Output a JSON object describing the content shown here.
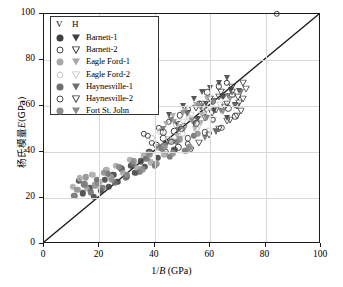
{
  "chart": {
    "type": "scatter",
    "title": "",
    "xlabel": "1/B (GPa)",
    "xlabel_prefix": "1/",
    "xlabel_italic": "B",
    "xlabel_suffix": " (GPa)",
    "ylabel": "杨氏模量E(GPa)",
    "ylabel_prefix": "杨氏模量",
    "ylabel_italic": "E",
    "ylabel_suffix": "(GPa)",
    "xlim": [
      0,
      100
    ],
    "ylim": [
      0,
      100
    ],
    "xticks": [
      0,
      20,
      40,
      60,
      80,
      100
    ],
    "yticks": [
      0,
      20,
      40,
      60,
      80,
      100
    ],
    "grid": true,
    "reference_line": {
      "name": "1:1 line",
      "from": [
        0,
        0
      ],
      "to": [
        100,
        100
      ]
    }
  },
  "legend": {
    "header_v": "V",
    "header_h": "H",
    "entries": [
      {
        "label": "Barnett-1",
        "key": "barnett1",
        "color": "#3f3f3f",
        "v_style": "circle-filled",
        "h_style": "triangle-filled"
      },
      {
        "label": "Barnett-2",
        "key": "barnett2",
        "color": "#3f3f3f",
        "v_style": "circle-open",
        "h_style": "triangle-open"
      },
      {
        "label": "Eagle Ford-1",
        "key": "eagleford1",
        "color": "#a8a8a8",
        "v_style": "circle-filled",
        "h_style": "triangle-filled"
      },
      {
        "label": "Eagle Ford-2",
        "key": "eagleford2",
        "color": "#c9c9c9",
        "v_style": "circle-open",
        "h_style": "triangle-open"
      },
      {
        "label": "Haynesville-1",
        "key": "haynesville1",
        "color": "#6e6e6e",
        "v_style": "circle-filled",
        "h_style": "triangle-filled"
      },
      {
        "label": "Haynesville-2",
        "key": "haynesville2",
        "color": "#4a4a4a",
        "v_style": "circle-open",
        "h_style": "triangle-open"
      },
      {
        "label": "Fort St. John",
        "key": "fortstjohn",
        "color": "#8c8c8c",
        "v_style": "circle-filled",
        "h_style": "triangle-filled"
      }
    ]
  },
  "chart_data": {
    "type": "scatter",
    "title": "",
    "xlabel": "1/B (GPa)",
    "ylabel": "杨氏模量E(GPa)",
    "xlim": [
      0,
      100
    ],
    "ylim": [
      0,
      100
    ],
    "xticks": [
      0,
      20,
      40,
      60,
      80,
      100
    ],
    "yticks": [
      0,
      20,
      40,
      60,
      80,
      100
    ],
    "grid": true,
    "legend_position": "upper-left",
    "reference_line": {
      "label": "1:1",
      "points": [
        [
          0,
          0
        ],
        [
          100,
          100
        ]
      ]
    },
    "series": [
      {
        "name": "Barnett-1 V",
        "marker": "circle-filled",
        "color": "#3f3f3f",
        "points": [
          [
            12.5,
            27.5
          ],
          [
            14.0,
            22.0
          ],
          [
            16.5,
            24.5
          ],
          [
            18.0,
            20.5
          ],
          [
            19.5,
            26.5
          ],
          [
            20.5,
            23.0
          ],
          [
            22.0,
            28.0
          ],
          [
            23.5,
            25.0
          ],
          [
            25.0,
            30.0
          ],
          [
            26.5,
            27.0
          ],
          [
            28.0,
            32.5
          ],
          [
            30.0,
            29.5
          ],
          [
            31.5,
            34.0
          ],
          [
            33.0,
            31.0
          ],
          [
            35.0,
            36.0
          ],
          [
            36.5,
            33.5
          ],
          [
            38.0,
            40.0
          ],
          [
            41.0,
            37.5
          ],
          [
            44.0,
            44.0
          ],
          [
            47.0,
            41.0
          ]
        ]
      },
      {
        "name": "Barnett-1 H",
        "marker": "triangle-filled",
        "color": "#3f3f3f",
        "points": [
          [
            45.0,
            56.0
          ],
          [
            48.0,
            52.0
          ],
          [
            50.0,
            60.0
          ],
          [
            52.0,
            57.0
          ],
          [
            54.0,
            63.0
          ],
          [
            55.5,
            54.5
          ],
          [
            57.0,
            66.0
          ],
          [
            58.5,
            61.0
          ],
          [
            60.0,
            68.0
          ],
          [
            61.5,
            58.0
          ],
          [
            63.0,
            70.0
          ],
          [
            64.5,
            64.0
          ],
          [
            66.0,
            72.0
          ],
          [
            67.5,
            67.0
          ],
          [
            69.0,
            60.5
          ],
          [
            70.5,
            66.5
          ],
          [
            62.0,
            48.5
          ],
          [
            66.0,
            55.0
          ]
        ]
      },
      {
        "name": "Barnett-2 V",
        "marker": "circle-open",
        "color": "#3f3f3f",
        "points": [
          [
            36.0,
            48.0
          ],
          [
            39.0,
            44.0
          ],
          [
            41.5,
            50.5
          ],
          [
            43.0,
            46.0
          ],
          [
            45.0,
            53.0
          ],
          [
            47.0,
            49.0
          ],
          [
            49.0,
            56.0
          ],
          [
            50.5,
            51.5
          ],
          [
            52.0,
            58.5
          ],
          [
            54.0,
            54.0
          ],
          [
            56.0,
            61.0
          ],
          [
            57.5,
            57.0
          ],
          [
            59.0,
            66.0
          ],
          [
            61.0,
            62.0
          ],
          [
            63.0,
            68.5
          ],
          [
            64.5,
            64.5
          ],
          [
            66.0,
            70.0
          ],
          [
            68.0,
            65.0
          ],
          [
            84.0,
            100.0
          ],
          [
            44.0,
            40.0
          ],
          [
            48.5,
            42.0
          ],
          [
            52.0,
            43.5
          ]
        ]
      },
      {
        "name": "Barnett-2 H",
        "marker": "triangle-open",
        "color": "#3f3f3f",
        "points": [
          [
            55.0,
            62.0
          ],
          [
            58.0,
            58.0
          ],
          [
            60.0,
            66.0
          ],
          [
            62.0,
            61.5
          ],
          [
            64.0,
            69.0
          ],
          [
            66.0,
            64.0
          ],
          [
            68.0,
            71.5
          ],
          [
            70.0,
            67.0
          ],
          [
            72.0,
            73.0
          ],
          [
            71.0,
            61.0
          ],
          [
            67.0,
            57.0
          ],
          [
            63.0,
            53.0
          ],
          [
            59.5,
            50.5
          ],
          [
            56.0,
            47.0
          ],
          [
            53.0,
            44.0
          ],
          [
            69.5,
            63.0
          ]
        ]
      },
      {
        "name": "Eagle Ford-1 V",
        "marker": "circle-filled",
        "color": "#a8a8a8",
        "points": [
          [
            10.5,
            25.0
          ],
          [
            13.0,
            28.5
          ],
          [
            15.5,
            24.0
          ],
          [
            17.5,
            30.0
          ],
          [
            20.0,
            27.0
          ],
          [
            22.5,
            32.0
          ],
          [
            24.0,
            29.0
          ],
          [
            26.0,
            34.0
          ],
          [
            28.5,
            31.0
          ],
          [
            31.0,
            36.5
          ],
          [
            33.5,
            33.0
          ],
          [
            36.0,
            38.5
          ],
          [
            38.5,
            35.5
          ],
          [
            41.0,
            42.0
          ],
          [
            43.5,
            39.0
          ],
          [
            46.0,
            45.0
          ]
        ]
      },
      {
        "name": "Eagle Ford-1 H",
        "marker": "triangle-filled",
        "color": "#a8a8a8",
        "points": [
          [
            44.0,
            52.0
          ],
          [
            46.5,
            55.5
          ],
          [
            49.0,
            51.0
          ],
          [
            51.0,
            58.0
          ],
          [
            53.0,
            54.0
          ],
          [
            55.0,
            60.5
          ],
          [
            57.0,
            56.0
          ],
          [
            59.0,
            63.0
          ],
          [
            48.0,
            47.0
          ],
          [
            50.5,
            49.5
          ],
          [
            54.5,
            50.0
          ],
          [
            56.5,
            52.5
          ]
        ]
      },
      {
        "name": "Eagle Ford-2 V",
        "marker": "circle-open",
        "color": "#c9c9c9",
        "points": [
          [
            39.0,
            46.0
          ],
          [
            42.0,
            49.0
          ],
          [
            45.0,
            45.5
          ],
          [
            47.5,
            52.0
          ],
          [
            50.0,
            48.0
          ],
          [
            52.5,
            55.0
          ],
          [
            55.0,
            50.0
          ],
          [
            57.0,
            57.5
          ]
        ]
      },
      {
        "name": "Eagle Ford-2 H",
        "marker": "triangle-open",
        "color": "#c9c9c9",
        "points": [
          [
            50.0,
            56.0
          ],
          [
            53.0,
            59.0
          ],
          [
            56.0,
            54.5
          ],
          [
            58.5,
            61.0
          ],
          [
            61.0,
            57.0
          ],
          [
            63.5,
            63.5
          ],
          [
            60.0,
            52.0
          ]
        ]
      },
      {
        "name": "Haynesville-1 V",
        "marker": "circle-filled",
        "color": "#6e6e6e",
        "points": [
          [
            11.0,
            21.0
          ],
          [
            14.5,
            26.0
          ],
          [
            17.0,
            22.5
          ],
          [
            19.0,
            28.0
          ],
          [
            21.0,
            24.5
          ],
          [
            23.0,
            30.5
          ],
          [
            25.5,
            26.5
          ],
          [
            27.5,
            33.0
          ],
          [
            29.5,
            29.0
          ],
          [
            32.0,
            35.0
          ],
          [
            34.5,
            31.5
          ],
          [
            37.0,
            37.0
          ],
          [
            40.0,
            34.0
          ],
          [
            42.5,
            41.5
          ],
          [
            45.5,
            38.0
          ],
          [
            48.0,
            44.5
          ],
          [
            51.0,
            40.5
          ],
          [
            54.0,
            47.0
          ]
        ]
      },
      {
        "name": "Haynesville-1 H",
        "marker": "triangle-filled",
        "color": "#6e6e6e",
        "points": [
          [
            43.0,
            50.0
          ],
          [
            46.0,
            54.0
          ],
          [
            48.5,
            49.5
          ],
          [
            51.5,
            56.5
          ],
          [
            54.0,
            52.0
          ],
          [
            56.5,
            59.0
          ],
          [
            59.0,
            55.0
          ],
          [
            61.5,
            62.0
          ],
          [
            64.0,
            58.0
          ],
          [
            66.5,
            64.5
          ],
          [
            69.0,
            60.0
          ],
          [
            71.0,
            66.0
          ],
          [
            58.0,
            46.0
          ],
          [
            62.0,
            49.0
          ]
        ]
      },
      {
        "name": "Haynesville-2 V",
        "marker": "circle-open",
        "color": "#4a4a4a",
        "points": [
          [
            37.5,
            47.0
          ],
          [
            40.5,
            43.0
          ],
          [
            43.0,
            48.5
          ],
          [
            46.0,
            44.5
          ],
          [
            49.5,
            50.0
          ],
          [
            52.0,
            46.0
          ],
          [
            55.0,
            52.5
          ],
          [
            58.0,
            48.5
          ],
          [
            61.0,
            54.0
          ],
          [
            64.0,
            50.5
          ],
          [
            66.5,
            59.0
          ],
          [
            69.0,
            55.5
          ]
        ]
      },
      {
        "name": "Haynesville-2 H",
        "marker": "triangle-open",
        "color": "#4a4a4a",
        "points": [
          [
            57.0,
            64.0
          ],
          [
            60.5,
            60.0
          ],
          [
            63.0,
            67.0
          ],
          [
            65.5,
            62.5
          ],
          [
            68.0,
            69.0
          ],
          [
            70.5,
            64.5
          ],
          [
            73.0,
            70.5
          ],
          [
            66.0,
            56.5
          ],
          [
            69.5,
            58.5
          ],
          [
            72.0,
            66.0
          ]
        ]
      },
      {
        "name": "Fort St. John V",
        "marker": "circle-filled",
        "color": "#8c8c8c",
        "points": [
          [
            12.0,
            23.5
          ],
          [
            15.0,
            29.0
          ],
          [
            18.5,
            25.5
          ],
          [
            21.5,
            31.0
          ],
          [
            24.5,
            28.0
          ],
          [
            27.0,
            33.5
          ],
          [
            30.0,
            30.0
          ],
          [
            32.5,
            36.0
          ],
          [
            35.5,
            32.5
          ],
          [
            38.0,
            39.0
          ],
          [
            40.5,
            35.0
          ],
          [
            43.5,
            42.5
          ],
          [
            46.5,
            39.5
          ],
          [
            49.0,
            45.5
          ],
          [
            52.5,
            42.0
          ],
          [
            55.5,
            48.0
          ]
        ]
      },
      {
        "name": "Fort St. John H",
        "marker": "triangle-filled",
        "color": "#8c8c8c",
        "points": [
          [
            47.0,
            53.0
          ],
          [
            50.0,
            57.0
          ],
          [
            53.5,
            53.5
          ],
          [
            56.0,
            60.0
          ],
          [
            58.5,
            55.0
          ],
          [
            61.0,
            61.5
          ],
          [
            64.5,
            57.5
          ],
          [
            67.0,
            63.0
          ]
        ]
      }
    ]
  }
}
